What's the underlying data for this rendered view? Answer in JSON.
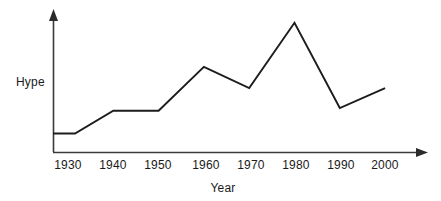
{
  "chart_data": {
    "type": "line",
    "title": "",
    "subtitle": "",
    "xlabel": "Year",
    "ylabel": "Hype",
    "categories": [
      "1930",
      "1940",
      "1950",
      "1960",
      "1970",
      "1980",
      "1990",
      "2000"
    ],
    "x": [
      1930,
      1940,
      1950,
      1960,
      1970,
      1980,
      1990,
      2000
    ],
    "values": [
      13,
      29,
      29,
      60,
      45,
      91,
      31,
      45
    ],
    "series": [
      {
        "name": "Hype",
        "values": [
          13,
          29,
          29,
          60,
          45,
          91,
          31,
          45
        ]
      }
    ],
    "annotations": [],
    "legend": "none",
    "grid": false,
    "xlim": [
      1925,
      2004
    ],
    "ylim": [
      0,
      100
    ],
    "axis_style": "arrow-ended open axes, no tick marks, no y-axis scale",
    "line_color": "#1c1c1c",
    "axis_color": "#3a3a3a",
    "background_color": "#ffffff",
    "note_leading_flat": "line begins flat at the y-axis before rising toward 1940"
  },
  "axes": {
    "x_tick_labels": [
      "1930",
      "1940",
      "1950",
      "1960",
      "1970",
      "1980",
      "1990",
      "2000"
    ],
    "y_tick_labels": [],
    "x_axis_label": "Year",
    "y_axis_label": "Hype"
  }
}
